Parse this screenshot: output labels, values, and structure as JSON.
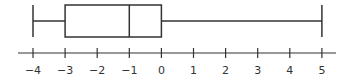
{
  "chart_data": {
    "type": "boxplot",
    "title": "",
    "xlabel": "",
    "ylabel": "",
    "xlim": [
      -4.5,
      5.5
    ],
    "ticks": [
      -4,
      -3,
      -2,
      -1,
      0,
      1,
      2,
      3,
      4,
      5
    ],
    "tick_labels": [
      "−4",
      "−3",
      "−2",
      "−1",
      "0",
      "1",
      "2",
      "3",
      "4",
      "5"
    ],
    "min": -4,
    "q1": -3,
    "median": -1,
    "q3": 0,
    "max": 5,
    "grid": false,
    "legend": false
  },
  "colors": {
    "stroke": "#333333",
    "background": "#ffffff"
  }
}
